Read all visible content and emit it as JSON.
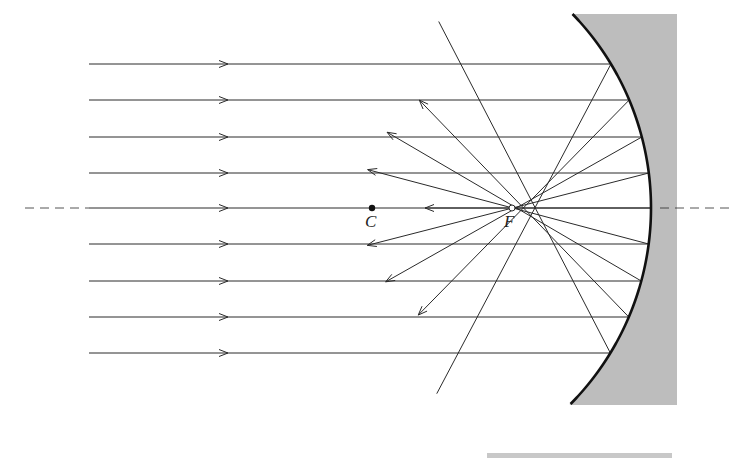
{
  "diagram": {
    "labels": {
      "center": "C",
      "focus": "F"
    },
    "colors": {
      "ink": "#2a2a2a",
      "mirror_fill": "#bdbdbd",
      "background": "#ffffff"
    },
    "incident_rays_y": [
      64,
      100,
      137,
      173,
      208,
      244,
      281,
      317,
      353
    ],
    "ray_start_x": 89,
    "arrow_x": 228,
    "axis_y": 208,
    "center_point": {
      "x": 372,
      "y": 208
    },
    "focal_point": {
      "x": 512,
      "y": 208
    },
    "mirror": {
      "top": [
        572,
        14
      ],
      "apex": [
        651,
        208
      ],
      "bottom": [
        571,
        405
      ],
      "back_x": 677
    }
  }
}
